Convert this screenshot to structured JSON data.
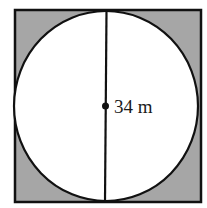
{
  "diagram": {
    "label": "34 m",
    "colors": {
      "shade": "#a6a6a6",
      "circle_fill": "#ffffff",
      "stroke": "#111111"
    }
  }
}
